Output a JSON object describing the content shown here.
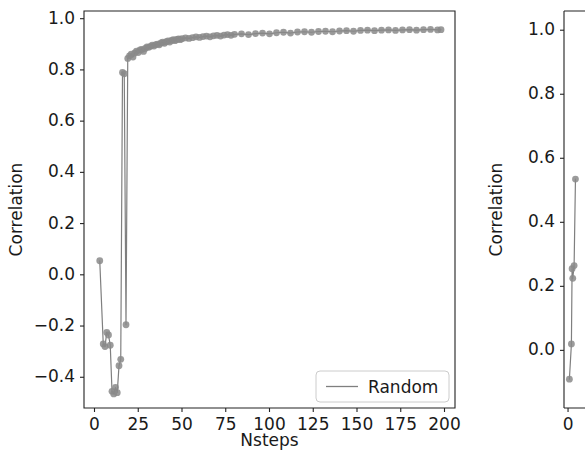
{
  "figure": {
    "background": "#ffffff",
    "series_color": "#7f7f7f",
    "marker_color": "#8a8a8a",
    "axis_color": "#222222"
  },
  "chart_data": [
    {
      "panel": "left",
      "type": "line",
      "title": "",
      "xlabel": "Nsteps",
      "ylabel": "Correlation",
      "xlim": [
        -6,
        206
      ],
      "ylim": [
        -0.52,
        1.03
      ],
      "xticks": [
        0,
        25,
        50,
        75,
        100,
        125,
        150,
        175,
        200
      ],
      "xticklabels": [
        "0",
        "25",
        "50",
        "75",
        "100",
        "125",
        "150",
        "175",
        "200"
      ],
      "yticks": [
        -0.4,
        -0.2,
        0.0,
        0.2,
        0.4,
        0.6,
        0.8,
        1.0
      ],
      "yticklabels": [
        "−0.4",
        "−0.2",
        "0.0",
        "0.2",
        "0.4",
        "0.6",
        "0.8",
        "1.0"
      ],
      "grid": false,
      "markers": true,
      "legend": {
        "position": "lower right",
        "entries": [
          {
            "label": "Random",
            "color": "#7f7f7f",
            "style": "line"
          }
        ]
      },
      "series": [
        {
          "name": "Random",
          "x": [
            3,
            5,
            6,
            7,
            8,
            9,
            10,
            11,
            12,
            13,
            14,
            15,
            16,
            17,
            18,
            19,
            20,
            21,
            22,
            23,
            24,
            25,
            26,
            27,
            28,
            29,
            30,
            31,
            32,
            33,
            34,
            35,
            36,
            37,
            38,
            39,
            40,
            41,
            42,
            43,
            44,
            45,
            46,
            47,
            48,
            49,
            50,
            52,
            54,
            56,
            58,
            60,
            62,
            64,
            66,
            68,
            70,
            72,
            74,
            76,
            78,
            80,
            84,
            88,
            92,
            96,
            100,
            104,
            108,
            112,
            116,
            120,
            124,
            128,
            132,
            136,
            140,
            144,
            148,
            152,
            156,
            160,
            164,
            168,
            172,
            176,
            180,
            184,
            188,
            192,
            196,
            198
          ],
          "y": [
            0.055,
            -0.27,
            -0.28,
            -0.225,
            -0.235,
            -0.275,
            -0.455,
            -0.465,
            -0.44,
            -0.46,
            -0.355,
            -0.33,
            0.79,
            0.785,
            -0.195,
            0.845,
            0.855,
            0.862,
            0.85,
            0.866,
            0.873,
            0.868,
            0.878,
            0.88,
            0.872,
            0.884,
            0.89,
            0.888,
            0.892,
            0.897,
            0.893,
            0.899,
            0.901,
            0.898,
            0.905,
            0.908,
            0.904,
            0.91,
            0.913,
            0.909,
            0.915,
            0.918,
            0.914,
            0.919,
            0.921,
            0.918,
            0.922,
            0.925,
            0.923,
            0.926,
            0.929,
            0.927,
            0.93,
            0.932,
            0.929,
            0.933,
            0.935,
            0.932,
            0.936,
            0.938,
            0.935,
            0.939,
            0.941,
            0.938,
            0.942,
            0.944,
            0.941,
            0.945,
            0.947,
            0.944,
            0.948,
            0.949,
            0.947,
            0.95,
            0.951,
            0.949,
            0.952,
            0.953,
            0.951,
            0.954,
            0.955,
            0.953,
            0.955,
            0.956,
            0.954,
            0.956,
            0.957,
            0.955,
            0.957,
            0.958,
            0.956,
            0.957
          ]
        }
      ]
    },
    {
      "panel": "right",
      "type": "line",
      "title": "",
      "xlabel": "",
      "ylabel": "Correlation",
      "note": "second panel clipped at right edge of screenshot",
      "xlim": [
        -6,
        40
      ],
      "ylim": [
        -0.18,
        1.06
      ],
      "xticks": [
        0
      ],
      "xticklabels": [
        "0"
      ],
      "yticks": [
        0.0,
        0.2,
        0.4,
        0.6,
        0.8,
        1.0
      ],
      "yticklabels": [
        "0.0",
        "0.2",
        "0.4",
        "0.6",
        "0.8",
        "1.0"
      ],
      "grid": false,
      "markers": true,
      "series": [
        {
          "name": "Random",
          "x": [
            2,
            5,
            6,
            7,
            9,
            11
          ],
          "y": [
            -0.09,
            0.02,
            0.255,
            0.225,
            0.265,
            0.535
          ]
        }
      ]
    }
  ]
}
